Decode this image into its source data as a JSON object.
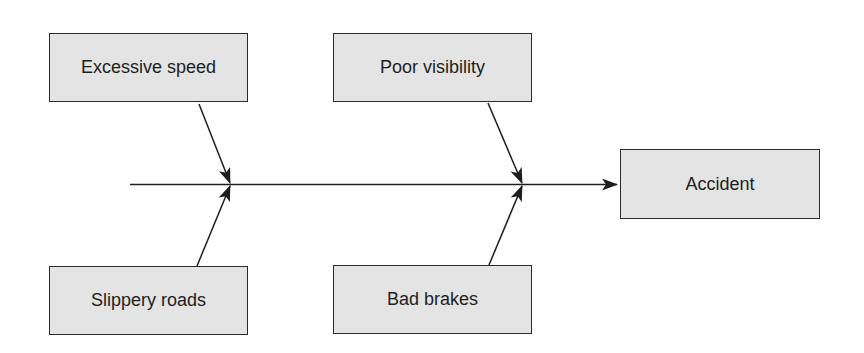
{
  "diagram": {
    "type": "fishbone (cause and effect)",
    "effect": {
      "label": "Accident"
    },
    "causes": [
      {
        "id": "excessive-speed",
        "label": "Excessive speed",
        "position": "top-left"
      },
      {
        "id": "poor-visibility",
        "label": "Poor visibility",
        "position": "top-right"
      },
      {
        "id": "slippery-roads",
        "label": "Slippery roads",
        "position": "bottom-left"
      },
      {
        "id": "bad-brakes",
        "label": "Bad brakes",
        "position": "bottom-right"
      }
    ],
    "colors": {
      "box_fill": "#e4e4e4",
      "box_border": "#2a2a2a",
      "line": "#1e1e1e",
      "text": "#1e1e1e"
    }
  }
}
